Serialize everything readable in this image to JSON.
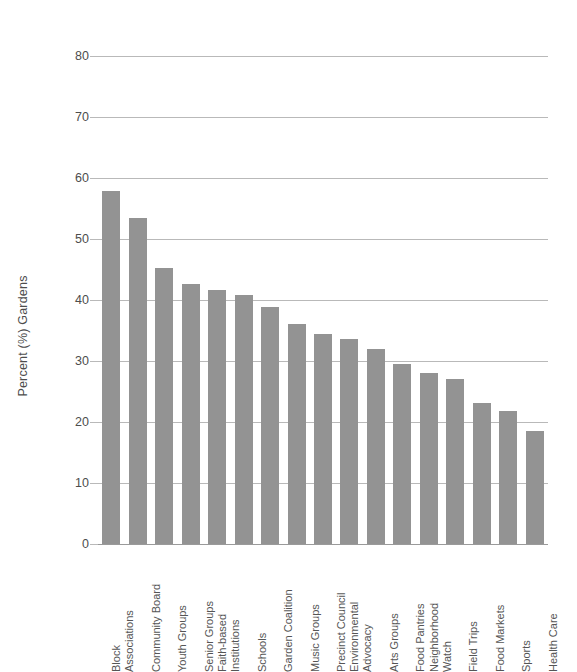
{
  "chart_data": {
    "type": "bar",
    "title": "",
    "xlabel": "",
    "ylabel": "Percent (%) Gardens",
    "ylim": [
      0,
      80
    ],
    "ytick_labels": [
      "80",
      "70",
      "60",
      "50",
      "40",
      "30",
      "20",
      "10",
      "0"
    ],
    "yticks": [
      80,
      70,
      60,
      50,
      40,
      30,
      20,
      10,
      0
    ],
    "grid": true,
    "legend": null,
    "bar_color": "#939393",
    "gridline_color": "#b9b9b9",
    "categories": [
      "Block Associations",
      "Community Board",
      "Youth Groups",
      "Senior Groups",
      "Faith-based Institutions",
      "Schools",
      "Garden Coalition",
      "Music Groups",
      "Precinct Council",
      "Environmental Advocacy",
      "Arts Groups",
      "Food Pantries",
      "Neighborhood Watch",
      "Field Trips",
      "Food Markets",
      "Sports",
      "Health Care"
    ],
    "category_lines": [
      [
        "Block",
        "Associations"
      ],
      [
        "Community Board"
      ],
      [
        "Youth Groups"
      ],
      [
        "Senior Groups"
      ],
      [
        "Faith-based",
        "Institutions"
      ],
      [
        "Schools"
      ],
      [
        "Garden Coalition"
      ],
      [
        "Music Groups"
      ],
      [
        "Precinct Council"
      ],
      [
        "Environmental",
        "Advocacy"
      ],
      [
        "Arts Groups"
      ],
      [
        "Food Pantries"
      ],
      [
        "Neighborhood",
        "Watch"
      ],
      [
        "Field Trips"
      ],
      [
        "Food Markets"
      ],
      [
        "Sports"
      ],
      [
        "Health Care"
      ]
    ],
    "values": [
      57.8,
      53.4,
      45.2,
      42.6,
      41.7,
      40.8,
      38.9,
      36.1,
      34.5,
      33.6,
      31.9,
      29.5,
      28.1,
      27.0,
      23.1,
      21.8,
      18.5
    ]
  }
}
